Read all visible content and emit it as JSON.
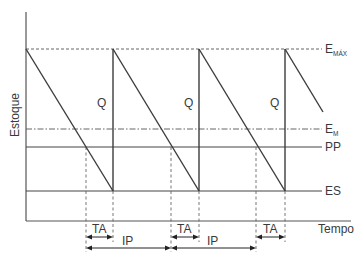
{
  "diagram": {
    "y_axis_label": "Estoque",
    "x_axis_label": "Tempo",
    "levels": [
      {
        "id": "emax",
        "label": "E",
        "subscript": "MÁX",
        "style": "dashed"
      },
      {
        "id": "em",
        "label": "E",
        "subscript": "M",
        "style": "dash-dot"
      },
      {
        "id": "pp",
        "label": "PP",
        "subscript": "",
        "style": "solid"
      },
      {
        "id": "es",
        "label": "ES",
        "subscript": "",
        "style": "solid"
      }
    ],
    "replenishment_label": "Q",
    "cycles": 3,
    "intervals": [
      {
        "label": "TA",
        "count": 3
      },
      {
        "label": "IP",
        "count": 2
      }
    ],
    "labels": {
      "q": "Q",
      "ta": "TA",
      "ip": "IP",
      "emax_main": "E",
      "emax_sub": "MÁX",
      "em_main": "E",
      "em_sub": "M",
      "pp": "PP",
      "es": "ES"
    }
  }
}
